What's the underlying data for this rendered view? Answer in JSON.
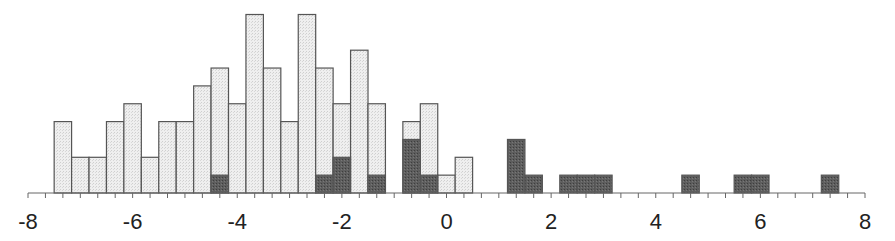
{
  "chart_data": {
    "type": "bar",
    "subtype": "stacked-histogram",
    "title": "",
    "xlabel": "",
    "ylabel": "",
    "xlim": [
      -8,
      8
    ],
    "x_ticks": [
      -8,
      -6,
      -4,
      -2,
      0,
      2,
      4,
      6,
      8
    ],
    "x_tick_labels": [
      "-8",
      "-6",
      "-4",
      "-2",
      "0",
      "2",
      "4",
      "6",
      "8"
    ],
    "minor_tick_step": 0.3333,
    "bin_width": 0.3333,
    "bin_start": -7.5,
    "grid": false,
    "legend": null,
    "series": [
      {
        "name": "light",
        "color": "#ececec",
        "values": [
          4,
          2,
          2,
          4,
          5,
          2,
          4,
          4,
          6,
          7,
          5,
          10,
          7,
          4,
          10,
          7,
          5,
          8,
          5,
          0,
          4,
          5,
          1,
          2,
          0,
          0,
          0,
          0,
          0,
          0,
          0,
          0,
          0,
          0,
          0,
          0,
          0,
          0,
          0,
          0,
          0,
          0,
          0,
          0
        ]
      },
      {
        "name": "dark",
        "color": "#5a5a5a",
        "values": [
          0,
          0,
          0,
          0,
          0,
          0,
          0,
          0,
          0,
          1,
          0,
          0,
          0,
          0,
          0,
          1,
          2,
          0,
          1,
          0,
          3,
          1,
          0,
          0,
          0,
          0,
          3,
          1,
          0,
          1,
          1,
          1,
          0,
          0,
          0,
          0,
          1,
          0,
          0,
          1,
          1,
          0,
          0,
          0,
          1
        ]
      }
    ],
    "note": "Light bars are total counts; dark bars are overlaid from the baseline (subset counts). Bins are 1/3 unit wide starting at -7.5."
  }
}
